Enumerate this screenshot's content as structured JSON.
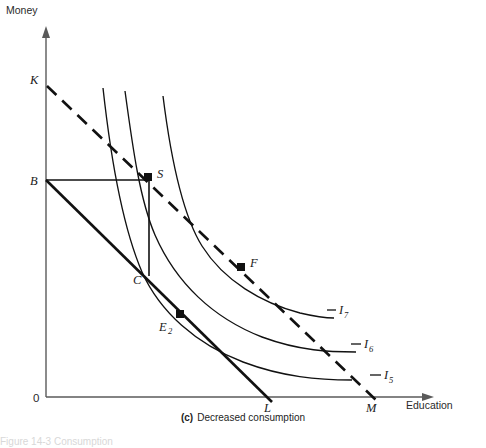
{
  "figure": {
    "panel_letter": "(c)",
    "panel_caption": "Decreased consumption",
    "footer_fragment": "Figure 14-3  Consumption"
  },
  "axes": {
    "y_label": "Money",
    "x_label": "Education",
    "origin_label": "0"
  },
  "points": [
    {
      "id": "K",
      "label": "K",
      "sub": "",
      "x": 46,
      "y": 84,
      "marked": false,
      "label_dx": -12,
      "label_dy": -3
    },
    {
      "id": "B",
      "label": "B",
      "sub": "",
      "x": 46,
      "y": 180,
      "marked": false,
      "label_dx": -13,
      "label_dy": 4
    },
    {
      "id": "S",
      "label": "S",
      "sub": "",
      "x": 148,
      "y": 177,
      "marked": true,
      "label_dx": 8,
      "label_dy": 0
    },
    {
      "id": "C",
      "label": "C",
      "sub": "",
      "x": 148,
      "y": 272,
      "marked": false,
      "label_dx": -13,
      "label_dy": 9
    },
    {
      "id": "E2",
      "label": "E",
      "sub": "2",
      "x": 180,
      "y": 314,
      "marked": true,
      "label_dx": -16,
      "label_dy": 15
    },
    {
      "id": "F",
      "label": "F",
      "sub": "",
      "x": 241,
      "y": 267,
      "marked": true,
      "label_dx": 8,
      "label_dy": -2
    },
    {
      "id": "L",
      "label": "L",
      "sub": "",
      "x": 268,
      "y": 397,
      "marked": false,
      "label_dx": -4,
      "label_dy": 15
    },
    {
      "id": "M",
      "label": "M",
      "sub": "",
      "x": 372,
      "y": 397,
      "marked": false,
      "label_dx": -5,
      "label_dy": 15
    }
  ],
  "curves": [
    {
      "id": "I7",
      "label": "I",
      "sub": "7",
      "label_x": 339,
      "label_y": 313
    },
    {
      "id": "I6",
      "label": "I",
      "sub": "6",
      "label_x": 364,
      "label_y": 347
    },
    {
      "id": "I5",
      "label": "I",
      "sub": "5",
      "label_x": 384,
      "label_y": 378
    }
  ],
  "lines": [
    {
      "id": "budget-BL",
      "style": "solid",
      "from": "B",
      "to": "L"
    },
    {
      "id": "budget-KM",
      "style": "dashed",
      "from": "K",
      "to": "M"
    },
    {
      "id": "connector-BS",
      "style": "solid-thin",
      "from": "B",
      "to": "S"
    },
    {
      "id": "connector-SC",
      "style": "solid-thin",
      "from": "S",
      "to": "C"
    }
  ],
  "colors": {
    "ink": "#111111",
    "axis": "#5a5a5a",
    "background": "#ffffff"
  }
}
